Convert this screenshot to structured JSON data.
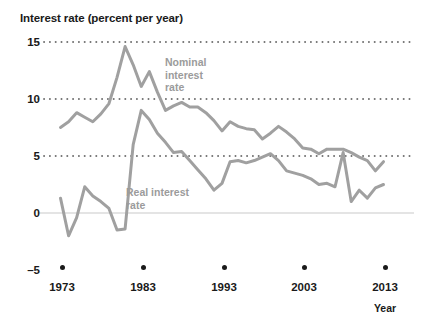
{
  "chart_data": {
    "type": "line",
    "title": "Interest rate (percent per year)",
    "xlabel": "Year",
    "ylabel": "Interest rate (percent per year)",
    "xlim": [
      1973,
      2013
    ],
    "ylim": [
      -5,
      15
    ],
    "yticks": [
      15,
      10,
      5,
      0,
      -5
    ],
    "ytick_labels": [
      "15",
      "10",
      "5",
      "0",
      "–5"
    ],
    "xticks": [
      1973,
      1983,
      1993,
      2003,
      2013
    ],
    "xtick_labels": [
      "1973",
      "1983",
      "1993",
      "2003",
      "2013"
    ],
    "grid": "horizontal-dotted",
    "legend_position": "inline-annotations",
    "x": [
      1973,
      1974,
      1975,
      1976,
      1977,
      1978,
      1979,
      1980,
      1981,
      1982,
      1983,
      1984,
      1985,
      1986,
      1987,
      1988,
      1989,
      1990,
      1991,
      1992,
      1993,
      1994,
      1995,
      1996,
      1997,
      1998,
      1999,
      2000,
      2001,
      2002,
      2003,
      2004,
      2005,
      2006,
      2007,
      2008,
      2009,
      2010,
      2011,
      2012,
      2013
    ],
    "series": [
      {
        "name": "Nominal interest rate",
        "color": "#a0a0a0",
        "values": [
          7.5,
          8.0,
          8.8,
          8.4,
          8.0,
          8.7,
          9.6,
          11.9,
          14.6,
          13.0,
          11.1,
          12.4,
          10.6,
          9.0,
          9.4,
          9.7,
          9.3,
          9.3,
          8.8,
          8.1,
          7.2,
          8.0,
          7.6,
          7.4,
          7.3,
          6.5,
          7.0,
          7.6,
          7.1,
          6.5,
          5.7,
          5.6,
          5.2,
          5.6,
          5.6,
          5.6,
          5.3,
          4.9,
          4.6,
          3.7,
          4.5
        ]
      },
      {
        "name": "Real interest rate",
        "color": "#a0a0a0",
        "values": [
          1.3,
          -2.0,
          -0.4,
          2.3,
          1.5,
          1.0,
          0.4,
          -1.5,
          -1.4,
          6.0,
          9.0,
          8.2,
          7.0,
          6.2,
          5.3,
          5.4,
          4.6,
          3.8,
          3.0,
          2.0,
          2.6,
          4.5,
          4.6,
          4.4,
          4.6,
          4.9,
          5.2,
          4.6,
          3.7,
          3.5,
          3.3,
          3.0,
          2.5,
          2.6,
          2.3,
          5.3,
          1.0,
          2.0,
          1.3,
          2.2,
          2.5
        ]
      }
    ],
    "annotations": [
      {
        "name": "nominal-series-label",
        "text": "Nominal\ninterest\nrate",
        "lines": [
          "Nominal",
          "interest",
          "rate"
        ]
      },
      {
        "name": "real-series-label",
        "text": "Real interest\nrate",
        "lines": [
          "Real interest",
          "rate"
        ]
      }
    ]
  },
  "labels": {
    "axis_title": "Interest rate (percent per year)",
    "year_label": "Year",
    "y_15": "15",
    "y_10": "10",
    "y_5": "5",
    "y_0": "0",
    "y_neg5": "–5",
    "x_1973": "1973",
    "x_1983": "1983",
    "x_1993": "1993",
    "x_2003": "2003",
    "x_2013": "2013",
    "nominal_l1": "Nominal",
    "nominal_l2": "interest",
    "nominal_l3": "rate",
    "real_l1": "Real interest",
    "real_l2": "rate"
  },
  "colors": {
    "line": "#a0a0a0",
    "grid": "#4a4a4a",
    "zero_line": "#c9c9c9",
    "text": "#1a1a1a",
    "annotation": "#9b9b9b"
  }
}
